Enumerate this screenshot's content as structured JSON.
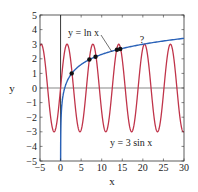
{
  "chart_data": {
    "type": "line",
    "title": "",
    "xlabel": "x",
    "ylabel": "y",
    "xlim": [
      -5,
      30
    ],
    "ylim": [
      -5,
      5
    ],
    "xticks": [
      -5,
      0,
      5,
      10,
      15,
      20,
      25,
      30
    ],
    "yticks": [
      -5,
      -4,
      -3,
      -2,
      -1,
      0,
      1,
      2,
      3,
      4,
      5
    ],
    "grid": false,
    "series": [
      {
        "name": "y = ln x",
        "function": "ln(x)",
        "domain": [
          0.0067,
          30
        ],
        "color": "#2a62b8"
      },
      {
        "name": "y = 3 sin x",
        "function": "3*sin(x)",
        "domain": [
          -5,
          30
        ],
        "color": "#c0344a"
      }
    ],
    "intersection_points": [
      {
        "x": 2.7,
        "y": 1.0
      },
      {
        "x": 7.0,
        "y": 1.95
      },
      {
        "x": 8.5,
        "y": 2.14
      },
      {
        "x": 13.7,
        "y": 2.62
      },
      {
        "x": 14.5,
        "y": 2.67
      }
    ],
    "annotations": [
      {
        "text": "y = ln x",
        "x": 3.7,
        "y": 4.0,
        "arrow_to": {
          "x": 11.8,
          "y": 2.47
        }
      },
      {
        "text": "y = 3 sin x",
        "x": 12.5,
        "y": -3.8
      },
      {
        "text": "?",
        "x": 20.5,
        "y": 3.4
      }
    ]
  },
  "labels": {
    "xlabel": "x",
    "ylabel": "y",
    "ln_label": "y = ln x",
    "sin_label": "y = 3 sin x",
    "question": "?"
  },
  "colors": {
    "ln": "#2a62b8",
    "sin": "#c0344a",
    "axis": "#333333",
    "dot": "#111111"
  }
}
